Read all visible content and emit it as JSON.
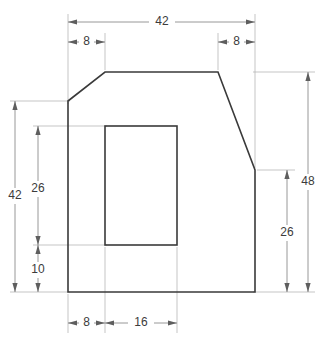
{
  "drawing": {
    "title": "Orthographic plate view with rectangular cutout",
    "line_color": "#3a3a3a",
    "dimension_color": "#7d7d7d",
    "extension_color": "#b6b6b6",
    "text_color": "#3c3c3c",
    "background": "#ffffff"
  },
  "dimensions": {
    "top_overall": "42",
    "top_left_chamfer": "8",
    "top_right_chamfer": "8",
    "left_overall": "42",
    "left_upper": "26",
    "left_lower": "10",
    "right_overall": "48",
    "right_lower": "26",
    "bottom_offset": "8",
    "bottom_cutout_width": "16"
  }
}
